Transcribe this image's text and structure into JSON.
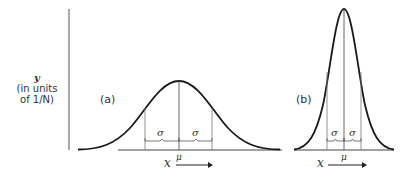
{
  "diagram": {
    "y_axis_label": {
      "variable": "y",
      "units_line1": "(in units",
      "units_line2": "of 1/N)"
    },
    "panel_a": {
      "label": "(a)",
      "sigma_left": "σ",
      "sigma_right": "σ",
      "mean_label": "μ",
      "x_label": "x"
    },
    "panel_b": {
      "label": "(b)",
      "sigma_left": "σ",
      "sigma_right": "σ",
      "mean_label": "μ",
      "x_label": "x"
    },
    "colors": {
      "curve": "#1a1a1a",
      "guide_lines": "#555555",
      "axis": "#444444"
    }
  }
}
